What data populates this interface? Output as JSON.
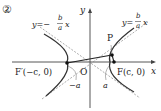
{
  "figure": {
    "number_label": "②",
    "axis_x_label": "x",
    "axis_y_label": "y",
    "origin_label": "O",
    "asymptote_left": {
      "prefix": "y=−",
      "num": "b",
      "den": "a",
      "var": "x"
    },
    "asymptote_right": {
      "prefix": "y=",
      "num": "b",
      "den": "a",
      "var": "x"
    },
    "point_p_label": "P",
    "focus_left_label": "F′(−c, 0)",
    "focus_right_label": "F(c, 0)",
    "vertex_left_label": "−a",
    "vertex_right_label": "a",
    "colors": {
      "curve": "#333333",
      "axis": "#444444",
      "asymptote": "#888888"
    }
  }
}
